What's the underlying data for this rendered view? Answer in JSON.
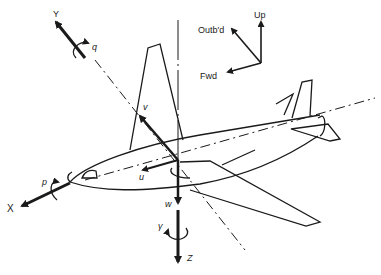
{
  "diagram": {
    "type": "aircraft body-axis coordinate system",
    "colors": {
      "stroke": "#1a1a1a",
      "background": "#ffffff"
    },
    "axes": {
      "x": {
        "label": "X",
        "velocity": "u",
        "rate": "p"
      },
      "y": {
        "label": "Y",
        "velocity": "v",
        "rate": "q"
      },
      "z": {
        "label": "Z",
        "velocity": "w",
        "rate": "γ"
      }
    },
    "reference_frame": {
      "up": "Up",
      "outboard": "Outb'd",
      "forward": "Fwd"
    }
  }
}
